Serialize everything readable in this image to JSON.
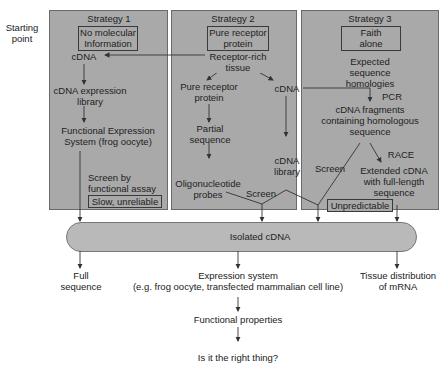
{
  "starting_point_label": [
    "Starting",
    "point"
  ],
  "strategies": [
    {
      "title": "Strategy 1",
      "start_box": [
        "No molecular",
        "Information"
      ],
      "nodes": {
        "cdna": "cDNA",
        "library": [
          "cDNA expression",
          "library"
        ],
        "system": [
          "Functional Expression",
          "System (frog oocyte)"
        ],
        "screen": [
          "Screen by",
          "functional assay"
        ]
      },
      "verdict": "Slow, unreliable"
    },
    {
      "title": "Strategy 2",
      "start_box": [
        "Pure receptor",
        "protein"
      ],
      "nodes": {
        "tissue": [
          "Receptor-rich",
          "tissue"
        ],
        "protein": [
          "Pure receptor",
          "protein"
        ],
        "cdna": "cDNA",
        "partial": [
          "Partial",
          "sequence"
        ],
        "library": [
          "cDNA",
          "library"
        ],
        "oligo": [
          "Oligonucleotide",
          "probes"
        ],
        "screen": "Screen"
      }
    },
    {
      "title": "Strategy 3",
      "start_box": [
        "Faith",
        "alone"
      ],
      "nodes": {
        "expected": [
          "Expected",
          "sequence",
          "homologies"
        ],
        "pcr": "PCR",
        "fragments": [
          "cDNA fragments",
          "containing homologous",
          "sequence"
        ],
        "race": "RACE",
        "screen": "Screen",
        "extended": [
          "Extended cDNA",
          "with full-length",
          "sequence"
        ]
      },
      "verdict": "Unpredictable"
    }
  ],
  "hub": "Isolated cDNA",
  "outcomes": {
    "full_sequence": [
      "Full",
      "sequence"
    ],
    "expression": [
      "Expression system",
      "(e.g. frog oocyte, transfected mammalian cell line)"
    ],
    "functional": "Functional properties",
    "right_thing": "Is it the right thing?",
    "tissue_distribution": [
      "Tissue distribution",
      "of mRNA"
    ]
  },
  "colors": {
    "panel": "#a9a9a9",
    "hub": "#b9b9b9",
    "line": "#333333"
  }
}
